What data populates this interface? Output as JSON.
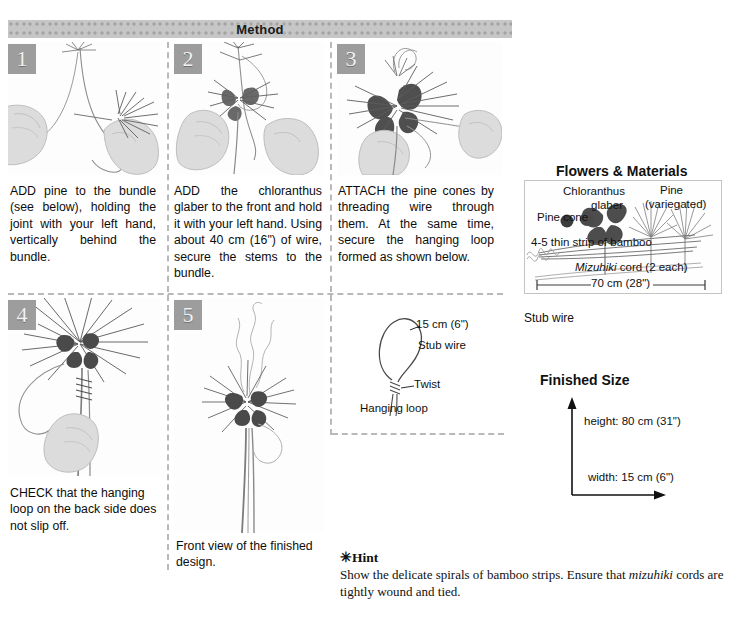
{
  "header": {
    "title": "Method"
  },
  "steps": [
    {
      "num": "1",
      "text": "ADD pine to the bundle (see below), holding the joint with your left hand, vertically behind the bundle."
    },
    {
      "num": "2",
      "text": "ADD the chloranthus glaber to the front and hold it with your left hand. Using about 40 cm (16\") of wire, secure the stems to the bundle."
    },
    {
      "num": "3",
      "text": "ATTACH the pine cones by threading wire through them. At the same time, secure the hanging loop formed as shown below."
    },
    {
      "num": "4",
      "text": "CHECK that the hanging loop on the back side does not slip off."
    },
    {
      "num": "5",
      "text": "Front view of the finished design."
    }
  ],
  "loop_diagram": {
    "length_label": "15 cm (6\")",
    "wire_label": "Stub wire",
    "twist_label": "Twist",
    "caption": "Hanging loop"
  },
  "materials": {
    "title": "Flowers & Materials",
    "chloranthus_line1": "Chloranthus",
    "chloranthus_line2": "glaber",
    "pine_line1": "Pine",
    "pine_line2": "(variegated)",
    "pine_cone": "Pine cone",
    "bamboo": "4-5 thin strip of bamboo",
    "mizuhiki_italic": "Mizuhiki",
    "mizuhiki_rest": " cord (2 each)",
    "length": "70 cm (28\")",
    "stub_wire": "Stub wire"
  },
  "finished_size": {
    "title": "Finished Size",
    "height": "height: 80 cm (31\")",
    "width": "width: 15 cm (6\")"
  },
  "hint": {
    "title": "✳Hint",
    "body_part1": "Show the delicate spirals of bamboo strips. Ensure that ",
    "body_italic": "mizuhiki",
    "body_part2": " cords are tightly wound and tied."
  },
  "colors": {
    "band": "#c6c6c6",
    "band_dot": "#a4a4a4",
    "step_badge": "#9d9d9d",
    "divider": "#b9b9b9",
    "text": "#111111"
  }
}
